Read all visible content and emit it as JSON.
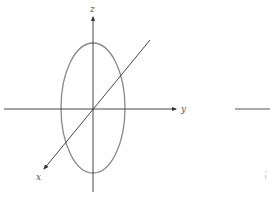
{
  "diagram": {
    "type": "3d-axes-with-ellipse",
    "axes": {
      "z": {
        "label": "z"
      },
      "y": {
        "label": "y"
      },
      "x": {
        "label": "x"
      }
    },
    "colors": {
      "axis": "#333333",
      "ellipse": "#888888",
      "label": "#555555",
      "background": "#ffffff"
    },
    "fragment": {
      "label": ""
    }
  }
}
